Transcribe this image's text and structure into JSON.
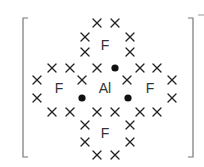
{
  "diagram": {
    "colors": {
      "cross": "#222222",
      "dot": "#111111",
      "label": "#333333",
      "bracket": "#777777"
    },
    "central_atom": {
      "symbol": "Al",
      "x": 105,
      "y": 88
    },
    "outer_atoms": [
      {
        "symbol": "F",
        "x": 105,
        "y": 45,
        "position": "top"
      },
      {
        "symbol": "F",
        "x": 59,
        "y": 88,
        "position": "left"
      },
      {
        "symbol": "F",
        "x": 150,
        "y": 88,
        "position": "right"
      },
      {
        "symbol": "F",
        "x": 105,
        "y": 133,
        "position": "bottom"
      }
    ],
    "charge": "−",
    "crosses": [
      [
        97,
        23
      ],
      [
        115,
        23
      ],
      [
        85,
        37
      ],
      [
        130,
        37
      ],
      [
        85,
        52
      ],
      [
        130,
        52
      ],
      [
        52,
        68
      ],
      [
        70,
        68
      ],
      [
        97,
        68
      ],
      [
        140,
        68
      ],
      [
        157,
        68
      ],
      [
        37,
        80
      ],
      [
        82,
        80
      ],
      [
        127,
        80
      ],
      [
        172,
        80
      ],
      [
        37,
        98
      ],
      [
        172,
        98
      ],
      [
        52,
        112
      ],
      [
        70,
        112
      ],
      [
        97,
        112
      ],
      [
        115,
        112
      ],
      [
        140,
        112
      ],
      [
        157,
        112
      ],
      [
        85,
        125
      ],
      [
        130,
        125
      ],
      [
        85,
        142
      ],
      [
        130,
        142
      ],
      [
        97,
        155
      ],
      [
        115,
        155
      ]
    ],
    "dots": [
      [
        115,
        68
      ],
      [
        82,
        98
      ],
      [
        128,
        98
      ]
    ]
  }
}
